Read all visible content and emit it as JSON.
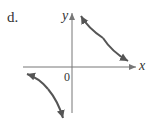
{
  "figure": {
    "label": "d.",
    "axes": {
      "x_label": "x",
      "y_label": "y",
      "origin_label": "0"
    },
    "curve_color": "#555555",
    "axis_color": "#777777"
  }
}
